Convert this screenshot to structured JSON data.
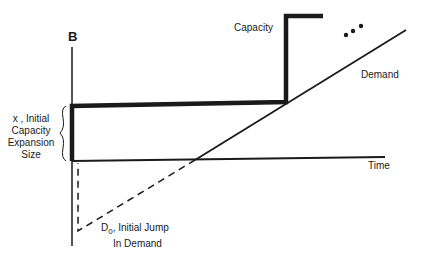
{
  "diagram": {
    "axis_label_top": "B",
    "x_axis_label": "Time",
    "capacity_label": "Capacity",
    "demand_label": "Demand",
    "initial_size_label": [
      "x , Initial",
      "Capacity",
      "Expansion",
      "Size"
    ],
    "d0_label_main": "D",
    "d0_label_sub": "0",
    "d0_label_rest": ", Initial Jump",
    "d0_label_line2": "In Demand",
    "continuation": "..."
  },
  "colors": {
    "line": "#1a1a1a",
    "background": "#ffffff"
  }
}
